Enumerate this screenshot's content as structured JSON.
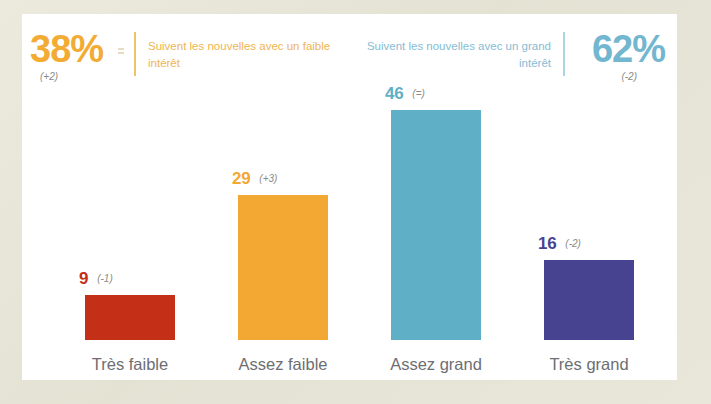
{
  "header": {
    "left": {
      "percent": "38%",
      "delta": "(+2)",
      "legend": "Suivent les nouvelles avec un faible intérêt",
      "color": "#f2ab33",
      "arrow": "double-chevron-icon"
    },
    "right": {
      "percent": "62%",
      "delta": "(-2)",
      "legend": "Suivent les nouvelles avec un grand intérêt",
      "color": "#73b6cf"
    }
  },
  "chart_data": {
    "type": "bar",
    "title": "",
    "xlabel": "",
    "ylabel": "",
    "ylim": [
      0,
      50
    ],
    "grid": false,
    "legend_position": "top",
    "categories": [
      "Très faible",
      "Assez faible",
      "Assez grand",
      "Très grand"
    ],
    "values": [
      9,
      29,
      46,
      16
    ],
    "value_labels": [
      "9",
      "29",
      "46",
      "16"
    ],
    "deltas": [
      "(-1)",
      "(+3)",
      "(=)",
      "(-2)"
    ],
    "colors": [
      "#c32f17",
      "#f2a833",
      "#5fafc6",
      "#474391"
    ],
    "annotations": [
      "38% suivent les nouvelles avec un faible intérêt (+2)",
      "62% suivent les nouvelles avec un grand intérêt (-2)"
    ]
  }
}
